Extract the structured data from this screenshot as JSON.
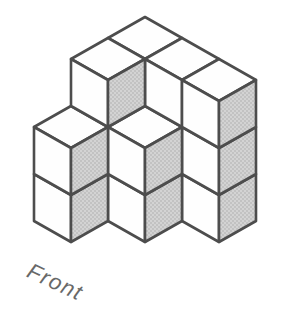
{
  "figure": {
    "type": "isometric-cube-stack",
    "label": "Front",
    "cube_count": 16,
    "grid": {
      "description": "heights[i][j]: i runs from back corner toward front-right, j runs from back corner toward front-left",
      "heights": [
        [
          3,
          3,
          2
        ],
        [
          3,
          2,
          0
        ],
        [
          3,
          0,
          0
        ]
      ]
    },
    "projection": {
      "origin_x": 145,
      "origin_y": 158,
      "half_width": 37,
      "half_height": 21,
      "cube_height": 47,
      "stroke_width": 2.6
    },
    "colors": {
      "background": "#ffffff",
      "outline": "#4d4d4d",
      "top_face": "#fefefe",
      "front_face": "#fefefe",
      "right_face_base": "#d3d3d3",
      "right_face_dot": "#a8a8a8",
      "label": "#686868"
    },
    "label_rotation_deg": 25
  }
}
